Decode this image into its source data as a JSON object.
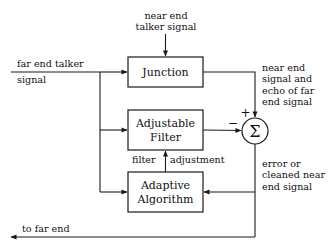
{
  "diagram": {
    "stroke_color": "#1a1a1a",
    "text_color": "#111111",
    "background": "#ffffff",
    "blocks": [
      {
        "id": "junction",
        "label_line1": "Junction",
        "label_line2": "",
        "x": 128,
        "y": 57,
        "w": 75,
        "h": 30
      },
      {
        "id": "adjustable-filter",
        "label_line1": "Adjustable",
        "label_line2": "Filter",
        "x": 128,
        "y": 110,
        "w": 75,
        "h": 40
      },
      {
        "id": "adaptive-algorithm",
        "label_line1": "Adaptive",
        "label_line2": "Algorithm",
        "x": 128,
        "y": 172,
        "w": 75,
        "h": 40
      }
    ],
    "summing_node": {
      "id": "summing-junction",
      "symbol": "Σ",
      "cx": 255,
      "cy": 131,
      "r": 13,
      "plus_sign": "+",
      "minus_sign": "−"
    },
    "labels": {
      "near_end_talker_signal": "near end\ntalker signal",
      "far_end_talker_signal_line1": "far end talker",
      "far_end_talker_signal_line2": "signal",
      "near_end_signal_and_echo": "near end\nsignal and\necho of far\nend signal",
      "error_or_cleaned": "error or\ncleaned near\nend signal",
      "filter_adjustment_left": "filter",
      "filter_adjustment_right": "adjustment",
      "to_far_end": "to far end"
    }
  }
}
